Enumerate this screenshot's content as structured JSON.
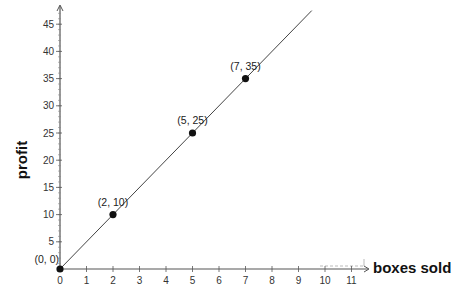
{
  "chart_data": {
    "type": "line",
    "title": "",
    "xlabel": "boxes sold",
    "ylabel": "profit",
    "xlim": [
      0,
      11.5
    ],
    "ylim": [
      0,
      47.5
    ],
    "x_ticks": [
      0,
      1,
      2,
      3,
      4,
      5,
      6,
      7,
      8,
      9,
      10,
      11
    ],
    "y_ticks": [
      5,
      10,
      15,
      20,
      25,
      30,
      35,
      40,
      45
    ],
    "grid": false,
    "line": {
      "slope": 5,
      "intercept": 0,
      "x_range": [
        0,
        9.5
      ]
    },
    "points": [
      {
        "x": 0,
        "y": 0,
        "label": "(0, 0)"
      },
      {
        "x": 2,
        "y": 10,
        "label": "(2, 10)"
      },
      {
        "x": 5,
        "y": 25,
        "label": "(5, 25)"
      },
      {
        "x": 7,
        "y": 35,
        "label": "(7, 35)"
      }
    ]
  },
  "colors": {
    "axis": "#555555",
    "line": "#444444",
    "point": "#111111"
  }
}
